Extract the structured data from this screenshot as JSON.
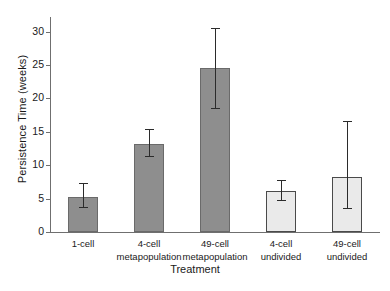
{
  "chart_data": {
    "type": "bar",
    "title": "",
    "xlabel": "Treatment",
    "ylabel": "Persistence Time (weeks)",
    "categories": [
      "1-cell",
      "4-cell\nmetapopulation",
      "49-cell\nmetapopulation",
      "4-cell\nundivided",
      "49-cell\nundivided"
    ],
    "values": [
      5.3,
      13.2,
      24.5,
      6.1,
      8.2
    ],
    "error_upper": [
      7.3,
      15.5,
      30.5,
      7.8,
      16.6
    ],
    "error_lower": [
      3.6,
      11.2,
      18.4,
      4.6,
      3.4
    ],
    "ylim": [
      0,
      31
    ],
    "yticks": [
      0,
      5,
      10,
      15,
      20,
      25,
      30
    ],
    "ytick_labels": [
      "0",
      "5",
      "10",
      "15",
      "20",
      "25",
      "30"
    ],
    "grid": false,
    "legend": "none",
    "bar_styles": [
      "dark",
      "dark",
      "dark",
      "light",
      "light"
    ],
    "colors": {
      "dark_fill": "#8e8e8e",
      "dark_edge": "#6a6a6a",
      "light_fill": "#eaeaea",
      "light_edge": "#4a4a4a",
      "axis": "#6f6f6f",
      "error": "#2b2b2b",
      "text": "#1a1a1a",
      "background": "#ffffff"
    }
  }
}
